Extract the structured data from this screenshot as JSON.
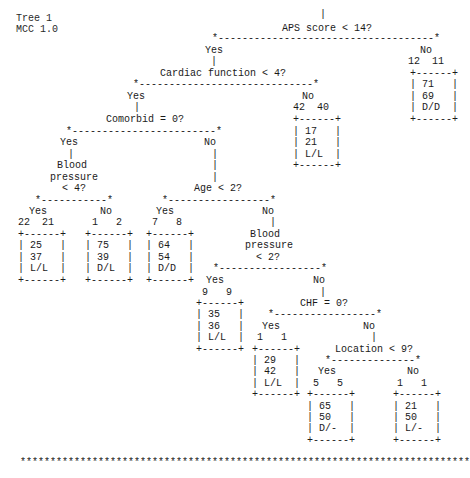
{
  "header": {
    "title": "Tree 1",
    "subtitle": "MCC 1.0"
  },
  "lines": [
    {
      "x": 320,
      "y": 9,
      "text": "|"
    },
    {
      "x": 282,
      "y": 23,
      "text": "APS score < 14?"
    },
    {
      "x": 212,
      "y": 33,
      "text": "*------------------------------------*"
    },
    {
      "x": 205,
      "y": 45,
      "text": "Yes"
    },
    {
      "x": 420,
      "y": 45,
      "text": "No"
    },
    {
      "x": 211,
      "y": 56,
      "text": "|"
    },
    {
      "x": 408,
      "y": 56,
      "text": "12  11"
    },
    {
      "x": 160,
      "y": 68,
      "text": "Cardiac function < 4?"
    },
    {
      "x": 410,
      "y": 68,
      "text": "+------+"
    },
    {
      "x": 133,
      "y": 79,
      "text": "*-----------------------------*"
    },
    {
      "x": 410,
      "y": 79,
      "text": "| 71   |"
    },
    {
      "x": 127,
      "y": 91,
      "text": "Yes"
    },
    {
      "x": 302,
      "y": 91,
      "text": "No"
    },
    {
      "x": 410,
      "y": 91,
      "text": "| 69   |"
    },
    {
      "x": 134,
      "y": 102,
      "text": "|"
    },
    {
      "x": 293,
      "y": 102,
      "text": "42  40"
    },
    {
      "x": 410,
      "y": 102,
      "text": "| D/D  |"
    },
    {
      "x": 106,
      "y": 114,
      "text": "Comorbid = 0?"
    },
    {
      "x": 293,
      "y": 114,
      "text": "+------+"
    },
    {
      "x": 410,
      "y": 114,
      "text": "+------+"
    },
    {
      "x": 66,
      "y": 126,
      "text": "*------------------------*"
    },
    {
      "x": 293,
      "y": 126,
      "text": "| 17   |"
    },
    {
      "x": 60,
      "y": 137,
      "text": "Yes"
    },
    {
      "x": 204,
      "y": 137,
      "text": "No"
    },
    {
      "x": 293,
      "y": 137,
      "text": "| 21   |"
    },
    {
      "x": 68,
      "y": 149,
      "text": "|"
    },
    {
      "x": 212,
      "y": 149,
      "text": "|"
    },
    {
      "x": 293,
      "y": 149,
      "text": "| L/L  |"
    },
    {
      "x": 57,
      "y": 160,
      "text": "Blood"
    },
    {
      "x": 212,
      "y": 160,
      "text": "|"
    },
    {
      "x": 293,
      "y": 160,
      "text": "+------+"
    },
    {
      "x": 50,
      "y": 172,
      "text": "pressure"
    },
    {
      "x": 212,
      "y": 172,
      "text": "|"
    },
    {
      "x": 62,
      "y": 183,
      "text": "< 4?"
    },
    {
      "x": 194,
      "y": 183,
      "text": "Age < 2?"
    },
    {
      "x": 35,
      "y": 195,
      "text": "*-----------*"
    },
    {
      "x": 162,
      "y": 195,
      "text": "*-----------------*"
    },
    {
      "x": 29,
      "y": 206,
      "text": "Yes"
    },
    {
      "x": 100,
      "y": 206,
      "text": "No"
    },
    {
      "x": 156,
      "y": 206,
      "text": "Yes"
    },
    {
      "x": 262,
      "y": 206,
      "text": "No"
    },
    {
      "x": 18,
      "y": 217,
      "text": "22  21"
    },
    {
      "x": 92,
      "y": 217,
      "text": "1   2"
    },
    {
      "x": 152,
      "y": 217,
      "text": "7   8"
    },
    {
      "x": 270,
      "y": 217,
      "text": "|"
    },
    {
      "x": 18,
      "y": 229,
      "text": "+------+"
    },
    {
      "x": 85,
      "y": 229,
      "text": "+------+"
    },
    {
      "x": 146,
      "y": 229,
      "text": "+------+"
    },
    {
      "x": 250,
      "y": 229,
      "text": "Blood"
    },
    {
      "x": 18,
      "y": 240,
      "text": "| 25   |"
    },
    {
      "x": 85,
      "y": 240,
      "text": "| 75   |"
    },
    {
      "x": 146,
      "y": 240,
      "text": "| 64   |"
    },
    {
      "x": 245,
      "y": 240,
      "text": "pressure"
    },
    {
      "x": 18,
      "y": 252,
      "text": "| 37   |"
    },
    {
      "x": 85,
      "y": 252,
      "text": "| 39   |"
    },
    {
      "x": 146,
      "y": 252,
      "text": "| 54   |"
    },
    {
      "x": 256,
      "y": 252,
      "text": "< 2?"
    },
    {
      "x": 18,
      "y": 263,
      "text": "| L/L  |"
    },
    {
      "x": 85,
      "y": 263,
      "text": "| D/L  |"
    },
    {
      "x": 146,
      "y": 263,
      "text": "| D/D  |"
    },
    {
      "x": 213,
      "y": 263,
      "text": "*-----------------*"
    },
    {
      "x": 18,
      "y": 275,
      "text": "+------+"
    },
    {
      "x": 85,
      "y": 275,
      "text": "+------+"
    },
    {
      "x": 146,
      "y": 275,
      "text": "+------+"
    },
    {
      "x": 206,
      "y": 275,
      "text": "Yes"
    },
    {
      "x": 313,
      "y": 275,
      "text": "No"
    },
    {
      "x": 202,
      "y": 287,
      "text": "9   9"
    },
    {
      "x": 320,
      "y": 287,
      "text": "|"
    },
    {
      "x": 196,
      "y": 298,
      "text": "+------+"
    },
    {
      "x": 300,
      "y": 298,
      "text": "CHF = 0?"
    },
    {
      "x": 196,
      "y": 309,
      "text": "| 35   |"
    },
    {
      "x": 268,
      "y": 309,
      "text": "*-----------------*"
    },
    {
      "x": 196,
      "y": 321,
      "text": "| 36   |"
    },
    {
      "x": 262,
      "y": 321,
      "text": "Yes"
    },
    {
      "x": 363,
      "y": 321,
      "text": "No"
    },
    {
      "x": 196,
      "y": 332,
      "text": "| L/L  |"
    },
    {
      "x": 257,
      "y": 332,
      "text": "1   1"
    },
    {
      "x": 371,
      "y": 332,
      "text": "|"
    },
    {
      "x": 196,
      "y": 344,
      "text": "+------+"
    },
    {
      "x": 252,
      "y": 344,
      "text": "+------+"
    },
    {
      "x": 335,
      "y": 344,
      "text": "Location < 9?"
    },
    {
      "x": 252,
      "y": 355,
      "text": "| 29   |"
    },
    {
      "x": 325,
      "y": 355,
      "text": "*--------------*"
    },
    {
      "x": 252,
      "y": 366,
      "text": "| 42   |"
    },
    {
      "x": 318,
      "y": 366,
      "text": "Yes"
    },
    {
      "x": 407,
      "y": 366,
      "text": "No"
    },
    {
      "x": 252,
      "y": 378,
      "text": "| L/L  |"
    },
    {
      "x": 313,
      "y": 378,
      "text": "5   5"
    },
    {
      "x": 397,
      "y": 378,
      "text": "1   1"
    },
    {
      "x": 252,
      "y": 389,
      "text": "+------+"
    },
    {
      "x": 307,
      "y": 389,
      "text": "+------+"
    },
    {
      "x": 393,
      "y": 389,
      "text": "+------+"
    },
    {
      "x": 307,
      "y": 401,
      "text": "| 65   |"
    },
    {
      "x": 393,
      "y": 401,
      "text": "| 21   |"
    },
    {
      "x": 307,
      "y": 412,
      "text": "| 50   |"
    },
    {
      "x": 393,
      "y": 412,
      "text": "| 50   |"
    },
    {
      "x": 307,
      "y": 423,
      "text": "| D/-  |"
    },
    {
      "x": 393,
      "y": 423,
      "text": "| L/-  |"
    },
    {
      "x": 307,
      "y": 435,
      "text": "+------+"
    },
    {
      "x": 393,
      "y": 435,
      "text": "+------+"
    },
    {
      "x": 20,
      "y": 457,
      "text": "***************************************************************************"
    }
  ],
  "tree": {
    "root": "APS score < 14?",
    "nodes": [
      {
        "question": "APS score < 14?",
        "yes": "Cardiac function < 4?",
        "no": {
          "counts": "12 11",
          "values": [
            "71",
            "69",
            "D/D"
          ]
        }
      },
      {
        "question": "Cardiac function < 4?",
        "yes": "Comorbid = 0?",
        "no": {
          "counts": "42 40",
          "values": [
            "17",
            "21",
            "L/L"
          ]
        }
      },
      {
        "question": "Comorbid = 0?",
        "yes": "Blood pressure < 4?",
        "no": "Age < 2?"
      },
      {
        "question": "Blood pressure < 4?",
        "yes": {
          "counts": "22 21",
          "values": [
            "25",
            "37",
            "L/L"
          ]
        },
        "no": {
          "counts": "1 2",
          "values": [
            "75",
            "39",
            "D/L"
          ]
        }
      },
      {
        "question": "Age < 2?",
        "yes": {
          "counts": "7 8",
          "values": [
            "64",
            "54",
            "D/D"
          ]
        },
        "no": "Blood pressure < 2?"
      },
      {
        "question": "Blood pressure < 2?",
        "yes": {
          "counts": "9 9",
          "values": [
            "35",
            "36",
            "L/L"
          ]
        },
        "no": "CHF = 0?"
      },
      {
        "question": "CHF = 0?",
        "yes": {
          "counts": "1 1",
          "values": [
            "29",
            "42",
            "L/L"
          ]
        },
        "no": "Location < 9?"
      },
      {
        "question": "Location < 9?",
        "yes": {
          "counts": "5 5",
          "values": [
            "65",
            "50",
            "D/-"
          ]
        },
        "no": {
          "counts": "1 1",
          "values": [
            "21",
            "50",
            "L/-"
          ]
        }
      }
    ]
  }
}
